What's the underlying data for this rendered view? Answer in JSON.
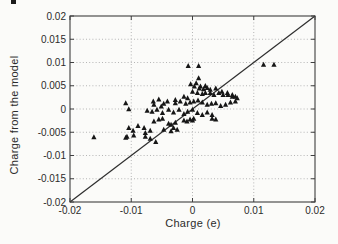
{
  "chart_data": {
    "type": "scatter",
    "title": "",
    "xlabel": "Charge (e)",
    "ylabel": "Charge from the model",
    "xlim": [
      -0.02,
      0.02
    ],
    "ylim": [
      -0.02,
      0.02
    ],
    "xticks": [
      -0.02,
      -0.01,
      0,
      0.01,
      0.02
    ],
    "xtick_labels": [
      "-0.02",
      "-0.01",
      "0",
      "0.01",
      "0.02"
    ],
    "yticks": [
      -0.02,
      -0.015,
      -0.01,
      -0.005,
      0,
      0.005,
      0.01,
      0.015,
      0.02
    ],
    "ytick_labels": [
      "-0.02",
      "-0.015",
      "-0.01",
      "-0.005",
      "0",
      "0.005",
      "0.01",
      "0.015",
      "0.02"
    ],
    "grid": true,
    "grid_style": "dotted",
    "legend": "none",
    "reference_line": {
      "type": "identity",
      "from": [
        -0.02,
        -0.02
      ],
      "to": [
        0.02,
        0.02
      ]
    },
    "marker": {
      "shape": "filled-triangle-up",
      "color": "#161616",
      "size_px": 5
    },
    "colors": {
      "axis": "#3f3f3f",
      "grid": "#b5b5b5",
      "text": "#2b2b2b",
      "diagonal": "#2e2e2e",
      "background": "#fbfbf9"
    },
    "points": [
      [
        -0.0007,
        0.0092
      ],
      [
        0.001,
        0.0092
      ],
      [
        0.0116,
        0.0095
      ],
      [
        0.0133,
        0.0095
      ],
      [
        0.001,
        0.0066
      ],
      [
        0.0006,
        0.0055
      ],
      [
        -0.0003,
        0.0053
      ],
      [
        0.0003,
        0.0048
      ],
      [
        0.0013,
        0.0048
      ],
      [
        0.0021,
        0.0049
      ],
      [
        0.0011,
        0.0044
      ],
      [
        0.0018,
        0.0042
      ],
      [
        0.0029,
        0.0041
      ],
      [
        0.0038,
        0.0044
      ],
      [
        0.0024,
        0.0045
      ],
      [
        0.0,
        0.0037
      ],
      [
        0.0008,
        0.0034
      ],
      [
        0.0016,
        0.0032
      ],
      [
        0.0021,
        0.0034
      ],
      [
        0.0029,
        0.0034
      ],
      [
        0.0035,
        0.003
      ],
      [
        0.0043,
        0.0034
      ],
      [
        0.0048,
        0.0037
      ],
      [
        0.005,
        0.003
      ],
      [
        0.0057,
        0.0034
      ],
      [
        0.0058,
        0.003
      ],
      [
        0.0065,
        0.003
      ],
      [
        0.0065,
        0.0026
      ],
      [
        0.007,
        0.0026
      ],
      [
        0.0073,
        0.0023
      ],
      [
        -0.0014,
        0.0026
      ],
      [
        -0.0008,
        0.0023
      ],
      [
        -0.0028,
        0.0019
      ],
      [
        -0.002,
        0.0016
      ],
      [
        -0.0041,
        0.0016
      ],
      [
        -0.0055,
        0.002
      ],
      [
        -0.0064,
        0.0016
      ],
      [
        -0.0109,
        0.0012
      ],
      [
        -0.0063,
        0.0009
      ],
      [
        -0.0051,
        0.0005
      ],
      [
        -0.0047,
        0.0011
      ],
      [
        -0.0028,
        0.0012
      ],
      [
        -0.0011,
        0.0011
      ],
      [
        -0.0004,
        0.0014
      ],
      [
        0.0002,
        0.0016
      ],
      [
        0.0009,
        0.0018
      ],
      [
        0.0016,
        0.0014
      ],
      [
        0.0024,
        0.0009
      ],
      [
        0.0031,
        0.0011
      ],
      [
        0.0038,
        0.0012
      ],
      [
        0.0046,
        0.0006
      ],
      [
        0.0054,
        0.0009
      ],
      [
        0.0062,
        0.0014
      ],
      [
        0.007,
        0.0016
      ],
      [
        -0.0104,
        -0.0001
      ],
      [
        -0.0074,
        -0.0004
      ],
      [
        -0.0066,
        -0.0006
      ],
      [
        -0.0058,
        -0.0002
      ],
      [
        -0.0049,
        -0.0009
      ],
      [
        -0.0039,
        -0.0002
      ],
      [
        -0.0031,
        -0.0008
      ],
      [
        -0.0022,
        -0.0002
      ],
      [
        -0.0014,
        -0.0011
      ],
      [
        -0.0008,
        -0.0006
      ],
      [
        0.0,
        -0.0002
      ],
      [
        0.0008,
        -0.0009
      ],
      [
        0.0016,
        -0.0013
      ],
      [
        0.0024,
        -0.0008
      ],
      [
        0.0032,
        -0.0013
      ],
      [
        -0.0063,
        -0.0027
      ],
      [
        -0.0055,
        -0.0023
      ],
      [
        -0.0049,
        -0.0021
      ],
      [
        -0.0039,
        -0.0032
      ],
      [
        -0.0035,
        -0.0034
      ],
      [
        -0.0028,
        -0.003
      ],
      [
        -0.0014,
        -0.0025
      ],
      [
        -0.0004,
        -0.0023
      ],
      [
        0.0002,
        -0.0021
      ],
      [
        0.0032,
        -0.0021
      ],
      [
        0.0038,
        -0.0023
      ],
      [
        0.0,
        -0.0025
      ],
      [
        -0.0009,
        -0.0027
      ],
      [
        -0.0031,
        -0.0041
      ],
      [
        -0.0025,
        -0.0045
      ],
      [
        -0.0035,
        -0.0048
      ],
      [
        -0.0047,
        -0.0045
      ],
      [
        -0.0104,
        -0.0041
      ],
      [
        -0.0097,
        -0.0047
      ],
      [
        -0.0089,
        -0.0037
      ],
      [
        -0.0079,
        -0.0041
      ],
      [
        -0.0077,
        -0.0052
      ],
      [
        -0.0069,
        -0.0047
      ],
      [
        -0.0161,
        -0.0061
      ],
      [
        -0.0107,
        -0.006
      ],
      [
        -0.0096,
        -0.0057
      ],
      [
        -0.0077,
        -0.006
      ],
      [
        -0.0069,
        -0.0064
      ],
      [
        -0.006,
        -0.0071
      ],
      [
        -0.0109,
        -0.0062
      ]
    ]
  }
}
